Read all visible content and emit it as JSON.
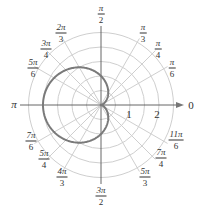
{
  "chart_data": {
    "type": "line",
    "subtype": "polar",
    "title": "",
    "equation_depicted": "r = 1 - cos(theta)",
    "curve_name": "cardioid",
    "series": [
      {
        "name": "cardioid",
        "color": "#7a7a7a",
        "theta_deg": [
          0,
          30,
          60,
          90,
          120,
          150,
          180,
          210,
          240,
          270,
          300,
          330,
          360
        ],
        "r": [
          0,
          0.134,
          0.5,
          1,
          1.5,
          1.866,
          2,
          1.866,
          1.5,
          1,
          0.5,
          0.134,
          0
        ]
      }
    ],
    "radial_ticks": [
      {
        "value": 1,
        "label": "1"
      },
      {
        "value": 2,
        "label": "2"
      }
    ],
    "radial_gridlines": [
      0.5,
      1,
      1.5,
      2,
      2.5
    ],
    "rlim": [
      0,
      2.5
    ],
    "angle_labels": [
      {
        "deg": 0,
        "num": "0",
        "den": ""
      },
      {
        "deg": 30,
        "num": "π",
        "den": "6"
      },
      {
        "deg": 45,
        "num": "π",
        "den": "4"
      },
      {
        "deg": 60,
        "num": "π",
        "den": "3"
      },
      {
        "deg": 90,
        "num": "π",
        "den": "2"
      },
      {
        "deg": 120,
        "num": "2π",
        "den": "3"
      },
      {
        "deg": 135,
        "num": "3π",
        "den": "4"
      },
      {
        "deg": 150,
        "num": "5π",
        "den": "6"
      },
      {
        "deg": 180,
        "num": "π",
        "den": ""
      },
      {
        "deg": 210,
        "num": "7π",
        "den": "6"
      },
      {
        "deg": 225,
        "num": "5π",
        "den": "4"
      },
      {
        "deg": 240,
        "num": "4π",
        "den": "3"
      },
      {
        "deg": 270,
        "num": "3π",
        "den": "2"
      },
      {
        "deg": 300,
        "num": "5π",
        "den": "3"
      },
      {
        "deg": 315,
        "num": "7π",
        "den": "4"
      },
      {
        "deg": 330,
        "num": "11π",
        "den": "6"
      }
    ],
    "grid": true,
    "legend": "none",
    "colors": {
      "grid": "#cfcfcf",
      "axis": "#555555",
      "curve": "#7a7a7a",
      "text": "#333333"
    }
  }
}
